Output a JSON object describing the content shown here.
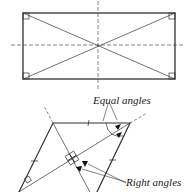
{
  "diagram": {
    "rectangle": {
      "description": "Rectangle with diagonals, dashed symmetry axes and right-angle marks at corners"
    },
    "rhombus": {
      "description": "Rhombus with diagonals, tick marks on equal sides, dashed extended diagonal",
      "labels": {
        "equal_angles": "Equal angles",
        "right_angles": "Right angles"
      }
    },
    "colors": {
      "stroke": "#333333",
      "arrow": "#111111",
      "background": "#ffffff"
    }
  }
}
